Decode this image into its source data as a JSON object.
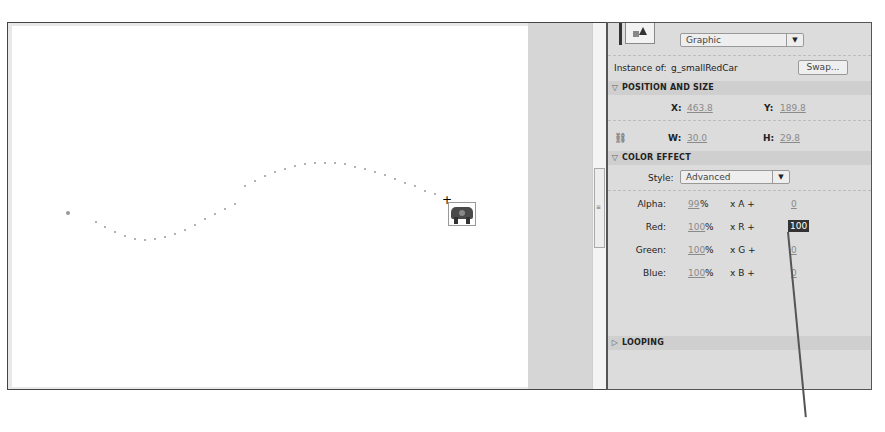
{
  "stage": {
    "motion_path_dots": [
      [
        95,
        221
      ],
      [
        104,
        226
      ],
      [
        114,
        231
      ],
      [
        124,
        235
      ],
      [
        134,
        238
      ],
      [
        144,
        239
      ],
      [
        154,
        238
      ],
      [
        164,
        236
      ],
      [
        174,
        233
      ],
      [
        184,
        229
      ],
      [
        194,
        224
      ],
      [
        204,
        218
      ],
      [
        214,
        213
      ],
      [
        224,
        208
      ],
      [
        234,
        203
      ],
      [
        244,
        185
      ],
      [
        254,
        180
      ],
      [
        264,
        175
      ],
      [
        274,
        171
      ],
      [
        284,
        168
      ],
      [
        294,
        165
      ],
      [
        304,
        163
      ],
      [
        314,
        162
      ],
      [
        324,
        162
      ],
      [
        334,
        162
      ],
      [
        344,
        163
      ],
      [
        354,
        166
      ],
      [
        364,
        168
      ],
      [
        374,
        171
      ],
      [
        384,
        174
      ],
      [
        394,
        178
      ],
      [
        404,
        182
      ],
      [
        414,
        185
      ],
      [
        424,
        190
      ],
      [
        434,
        193
      ]
    ],
    "start_point": [
      68,
      212
    ],
    "selected_symbol": "g_smallRedCar"
  },
  "properties": {
    "symbol_type": "Graphic",
    "instance_of_label": "Instance of:",
    "instance_of_value": "g_smallRedCar",
    "swap_label": "Swap...",
    "position_and_size": {
      "header": "POSITION AND SIZE",
      "x_label": "X:",
      "x_value": "463.8",
      "y_label": "Y:",
      "y_value": "189.8",
      "w_label": "W:",
      "w_value": "30.0",
      "h_label": "H:",
      "h_value": "29.8"
    },
    "color_effect": {
      "header": "COLOR EFFECT",
      "style_label": "Style:",
      "style_value": "Advanced",
      "rows": [
        {
          "label": "Alpha:",
          "pct": "99",
          "mult": "x A +",
          "offset": "0"
        },
        {
          "label": "Red:",
          "pct": "100",
          "mult": "x R +",
          "offset": "100"
        },
        {
          "label": "Green:",
          "pct": "100",
          "mult": "x G +",
          "offset": "0"
        },
        {
          "label": "Blue:",
          "pct": "100",
          "mult": "x B +",
          "offset": "0"
        }
      ],
      "percent_sign": "%"
    },
    "looping": {
      "header": "LOOPING"
    }
  },
  "icons": {
    "expanded": "▽",
    "collapsed": "▷",
    "dropdown": "▼",
    "link": "⛓"
  }
}
